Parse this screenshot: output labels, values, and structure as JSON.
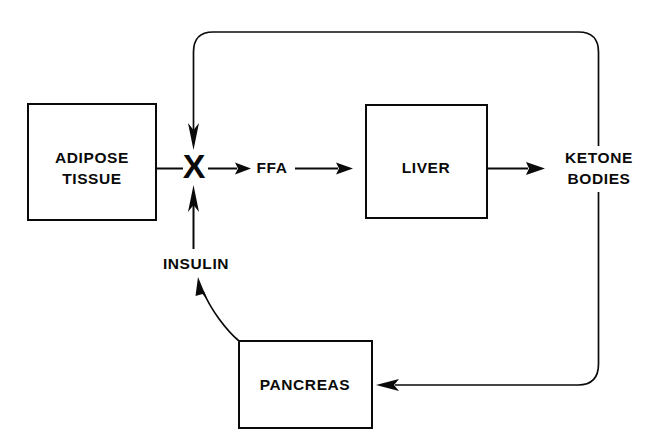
{
  "diagram": {
    "background_color": "#ffffff",
    "line_color": "#0a0a0a",
    "nodes": [
      {
        "id": "adipose",
        "label_line1": "ADIPOSE",
        "label_line2": "TISSUE",
        "shape": "box"
      },
      {
        "id": "liver",
        "label_line1": "LIVER",
        "label_line2": "",
        "shape": "box"
      },
      {
        "id": "pancreas",
        "label_line1": "PANCREAS",
        "label_line2": "",
        "shape": "box"
      }
    ],
    "labels": {
      "ffa": "FFA",
      "ketone_line1": "KETONE",
      "ketone_line2": "BODIES",
      "insulin": "INSULIN",
      "inhibition_symbol": "X"
    }
  }
}
